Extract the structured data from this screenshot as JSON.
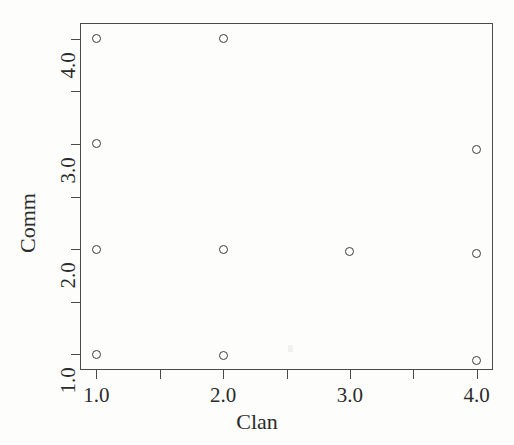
{
  "chart_data": {
    "type": "scatter",
    "title": "",
    "xlabel": "Clan",
    "ylabel": "Comm",
    "xlim": [
      0.87,
      4.13
    ],
    "ylim": [
      0.85,
      4.15
    ],
    "grid": false,
    "legend": null,
    "marker": "open-circle",
    "marker_color": "#3d3d3d",
    "x_ticks": [
      1.0,
      1.5,
      2.0,
      2.5,
      3.0,
      3.5,
      4.0
    ],
    "x_tick_labels": [
      "1.0",
      "",
      "2.0",
      "",
      "3.0",
      "",
      "4.0"
    ],
    "x_major_labels": [
      "1.0",
      "2.0",
      "3.0",
      "4.0"
    ],
    "y_ticks": [
      1.0,
      1.5,
      2.0,
      2.5,
      3.0,
      3.5,
      4.0
    ],
    "y_tick_labels": [
      "1.0",
      "",
      "2.0",
      "",
      "3.0",
      "",
      "4.0"
    ],
    "y_major_labels": [
      "1.0",
      "2.0",
      "3.0",
      "4.0"
    ],
    "points": [
      {
        "x": 1.0,
        "y": 4.0
      },
      {
        "x": 2.0,
        "y": 4.0
      },
      {
        "x": 1.0,
        "y": 3.0
      },
      {
        "x": 4.0,
        "y": 2.95
      },
      {
        "x": 1.0,
        "y": 2.0
      },
      {
        "x": 2.0,
        "y": 2.0
      },
      {
        "x": 3.0,
        "y": 1.98
      },
      {
        "x": 4.0,
        "y": 1.96
      },
      {
        "x": 1.0,
        "y": 1.0
      },
      {
        "x": 2.0,
        "y": 0.99
      },
      {
        "x": 4.0,
        "y": 0.94
      }
    ],
    "x": [
      1.0,
      2.0,
      1.0,
      4.0,
      1.0,
      2.0,
      3.0,
      4.0,
      1.0,
      2.0,
      4.0
    ],
    "y": [
      4.0,
      4.0,
      3.0,
      2.95,
      2.0,
      2.0,
      1.98,
      1.96,
      1.0,
      0.99,
      0.94
    ],
    "n_points": 11
  },
  "axes": {
    "frame_color": "#4a4a4a",
    "background": "#fdfdfc"
  }
}
